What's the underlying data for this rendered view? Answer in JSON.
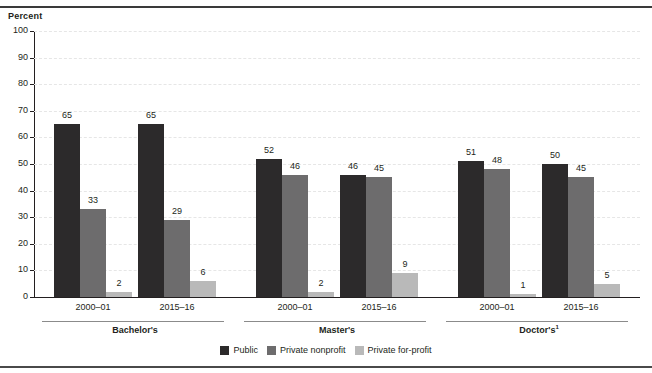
{
  "figure": {
    "axis_title": "Percent"
  },
  "legend": {
    "items": [
      {
        "label": "Public",
        "key": "public",
        "color": "#2c2a2b"
      },
      {
        "label": "Private nonprofit",
        "key": "nonprofit",
        "color": "#6d6c6d"
      },
      {
        "label": "Private for-profit",
        "key": "forprofit",
        "color": "#b9b9b9"
      }
    ]
  },
  "chart_data": {
    "type": "bar",
    "title": "",
    "subtitle": "",
    "xlabel": "",
    "ylabel": "Percent",
    "ylim": [
      0,
      100
    ],
    "yticks": [
      0,
      10,
      20,
      30,
      40,
      50,
      60,
      70,
      80,
      90,
      100
    ],
    "ytick_labels": [
      "0",
      "10",
      "20",
      "30",
      "40",
      "50",
      "60",
      "70",
      "80",
      "90",
      "100"
    ],
    "grid": "horizontal-dashed",
    "legend_position": "bottom-center",
    "groups": [
      {
        "label": "Bachelor's",
        "footnote": "",
        "categories": [
          "2000–01",
          "2015–16"
        ]
      },
      {
        "label": "Master's",
        "footnote": "",
        "categories": [
          "2000–01",
          "2015–16"
        ]
      },
      {
        "label": "Doctor's",
        "footnote": "1",
        "categories": [
          "2000–01",
          "2015–16"
        ]
      }
    ],
    "categories": [
      "Bachelor's 2000–01",
      "Bachelor's 2015–16",
      "Master's 2000–01",
      "Master's 2015–16",
      "Doctor's 2000–01",
      "Doctor's 2015–16"
    ],
    "series": [
      {
        "name": "Public",
        "color": "#2c2a2b",
        "values": [
          65,
          65,
          52,
          46,
          51,
          50
        ]
      },
      {
        "name": "Private nonprofit",
        "color": "#6d6c6d",
        "values": [
          33,
          29,
          46,
          45,
          48,
          45
        ]
      },
      {
        "name": "Private for-profit",
        "color": "#b9b9b9",
        "values": [
          2,
          6,
          2,
          9,
          1,
          5
        ]
      }
    ]
  }
}
